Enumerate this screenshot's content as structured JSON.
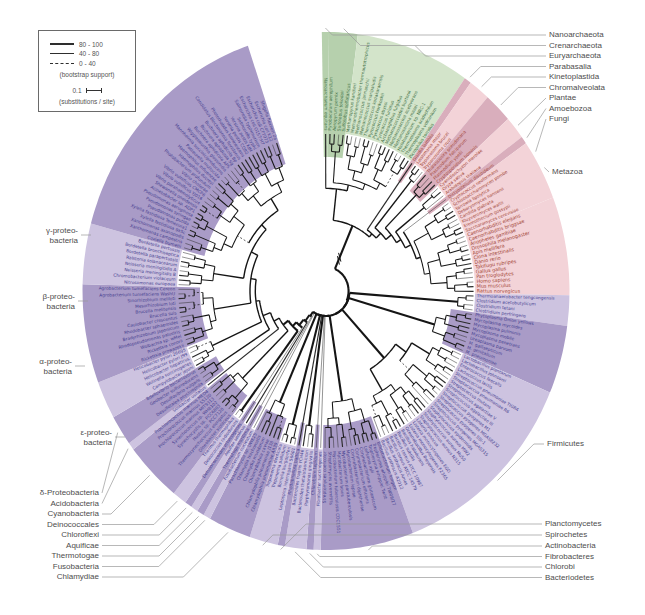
{
  "legend": {
    "items": [
      {
        "style": "thick",
        "label": "80 - 100"
      },
      {
        "style": "thin",
        "label": "40 - 80"
      },
      {
        "style": "dashed",
        "label": "0 - 40"
      }
    ],
    "caption": "(bootstrap support)",
    "scale_value": "0.1",
    "scale_caption": "(substitutions / site)"
  },
  "figure": {
    "cx": 326,
    "cy": 291,
    "kx": 0.94,
    "outer_r": 259,
    "label_r": 160.5,
    "light_inner_r": 158.5,
    "dark_inner_r": 134,
    "leaf_r": 157,
    "start_angle": -1,
    "arc_span": 342.3
  },
  "colors": {
    "green_dark": "#b6d0ad",
    "green_light": "#d3e4ca",
    "pink_dark": "#d9aebc",
    "pink_light": "#f3d3d8",
    "purple_dark": "#a99bc7",
    "purple_light": "#cdc3e0",
    "text_archaea": "#3f7046",
    "text_eukaryota": "#a14434",
    "text_bacteria": "#453e8f",
    "tree_line": "#151515",
    "connector": "#9a9a9a",
    "label_text": "#4d4d4d"
  },
  "groups": [
    {
      "id": "nanoarchaeota",
      "domain": "archaea",
      "band": "dark",
      "leaves": [
        "Nanoarchaeum equitans"
      ]
    },
    {
      "id": "crenarchaeota",
      "domain": "archaea",
      "band": "dark",
      "leaves": [
        "Pyrobaculum aerophilum",
        "Aeropyrum pernix",
        "Sulfolobus tokodaii",
        "Sulfolobus solfataricus"
      ]
    },
    {
      "id": "euryarchaeota",
      "domain": "archaea",
      "band": "light",
      "leaves": [
        "Methanopyrus kandleri",
        "Methanothermobacter thermautotrophicus",
        "Methanococcus jannaschii",
        "Methanococcus maripaludis",
        "Thermococcus kodakaraensis",
        "Pyrococcus horikoshii",
        "Pyrococcus abyssi",
        "Pyrococcus furiosus",
        "Archaeoglobus fulgidus",
        "Methanococcoides burtonii",
        "Methanosarcina acetivorans",
        "Methanosarcina mazei",
        "Halobacterium sp. NRC-1",
        "Thermoplasma acidophilum",
        "Thermoplasma volcanium",
        "Picrophilus torridus"
      ]
    },
    {
      "id": "parabasalia",
      "domain": "eukaryota",
      "band": "dark",
      "leaves": [
        "Giardia lamblia"
      ]
    },
    {
      "id": "kinetoplastida",
      "domain": "eukaryota",
      "band": "light",
      "leaves": [
        "Leishmania major",
        "Trypanosoma brucei",
        "Trypanosoma cruzi"
      ]
    },
    {
      "id": "chromalveolata",
      "domain": "eukaryota",
      "band": "dark",
      "leaves": [
        "Thalassiosira pseudonana",
        "Plasmodium falciparum",
        "Plasmodium yoelii",
        "Cryptosporidium hominis"
      ]
    },
    {
      "id": "plantae",
      "domain": "eukaryota",
      "band": "light",
      "leaves": [
        "Cyanidioschyzon merolae",
        "Oryza sativa",
        "Arabidopsis thaliana"
      ]
    },
    {
      "id": "amoebozoa",
      "domain": "eukaryota",
      "band": "dark",
      "leaves": [
        "Dictyostelium discoideum"
      ]
    },
    {
      "id": "fungi",
      "domain": "eukaryota",
      "band": "light",
      "leaves": [
        "Cryptococcus neoformans",
        "Schizosaccharomyces pombe",
        "Yarrowia lipolytica",
        "Debaryomyces hansenii",
        "Candida glabrata",
        "Kluyveromyces waltii",
        "Eremothecium gossypii",
        "Saccharomyces cerevisiae"
      ]
    },
    {
      "id": "metazoa",
      "domain": "eukaryota",
      "band": "light",
      "leaves": [
        "Caenorhabditis elegans",
        "Caenorhabditis briggsae",
        "Anopheles gambiae",
        "Drosophila melanogaster",
        "Apis mellifera",
        "Ciona intestinalis",
        "Danio rerio",
        "Takifugu rubripes",
        "Gallus gallus",
        "Pan troglodytes",
        "Homo sapiens",
        "Mus musculus",
        "Rattus norvegicus"
      ]
    },
    {
      "id": "clostridia",
      "domain": "bacteria",
      "band": "light",
      "leaves": [
        "Thermoanaerobacter tengcongensis",
        "Clostridium acetobutylicum",
        "Clostridium tetani",
        "Clostridium perfringens"
      ]
    },
    {
      "id": "mollicutes",
      "domain": "bacteria",
      "band": "dark",
      "leaves": [
        "Phytoplasma Onion yellows",
        "Mycoplasma mycoides",
        "Mycoplasma pulmonis",
        "Mycoplasma mobile",
        "Mycoplasma penetrans",
        "Ureaplasma parvum",
        "M. gallisepticum",
        "M. genitalium",
        "M. pneumoniae"
      ]
    },
    {
      "id": "bacilli",
      "domain": "bacteria",
      "band": "light",
      "leaves": [
        "Lactobacillus plantarum",
        "Lactobacillus johnsonii",
        "Enterococcus faecalis",
        "Lactococcus lactis",
        "Streptococcus pneumoniae TIGR4",
        "Streptococcus pneumoniae R6",
        "Streptococcus mutans",
        "Streptococcus agalactiae V",
        "Streptococcus agalactiae III",
        "Streptococcus pyogenes M1",
        "Streptococcus pyogenes MGAS8232",
        "Streptococcus pyogenes SSI-1",
        "Streptococcus pyogenes MGAS315",
        "Staphylococcus epidermidis",
        "Staphylococcus aureus MW2",
        "Staphylococcus aureus Mu50",
        "Staphylococcus aureus N315",
        "Listeria innocua",
        "Listeria monocytogenes EGD",
        "Listeria monocytogenes F2365",
        "Oceanobacillus iheyensis",
        "Bacillus halodurans",
        "Bacillus subtilis",
        "Bacillus cereus ATCC 10987",
        "Bacillus cereus ATCC 14579",
        "Bacillus anthracis Ames",
        "Bacillus anthracis A2012"
      ]
    },
    {
      "id": "actinobacteria",
      "domain": "bacteria",
      "band": "dark",
      "leaves": [
        "Bifidobacterium longum",
        "Tropheryma whipplei TW08/27",
        "Tropheryma whipplei Twist",
        "Leifsonia xyli",
        "Corynebacterium glutamicum",
        "Corynebacterium efficiens",
        "Corynebacterium diphtheriae",
        "Mycobacterium leprae",
        "Mycobacterium paratuberculosis",
        "Mycobacterium bovis",
        "Mycobacterium tuberculosis CDC1551",
        "Streptomyces avermitilis",
        "Streptomyces coelicolor"
      ]
    },
    {
      "id": "fibrobacteres",
      "domain": "bacteria",
      "band": "light",
      "leaves": [
        "Fibrobacter succinogenes"
      ]
    },
    {
      "id": "chlorobi",
      "domain": "bacteria",
      "band": "dark",
      "leaves": [
        "Chlorobium tepidum"
      ]
    },
    {
      "id": "bacteriodetes",
      "domain": "bacteria",
      "band": "light",
      "leaves": [
        "Porphyromonas gingivalis",
        "Bacteroides thetaiotaomicron",
        "Bacteroides fragilis YCH46"
      ]
    },
    {
      "id": "planctomycetes",
      "domain": "bacteria",
      "band": "dark",
      "leaves": [
        "Rhodopirellula baltica"
      ]
    },
    {
      "id": "spirochetes",
      "domain": "bacteria",
      "band": "light",
      "leaves": [
        "Leptospira interrogans 56601",
        "Borrelia burgdorferi",
        "Treponema pallidum",
        "Treponema denticola"
      ]
    },
    {
      "id": "chlamydiae",
      "domain": "bacteria",
      "band": "dark",
      "leaves": [
        "Chlamydophila pneumoniae AR39",
        "Chlamydophila pneumoniae J138",
        "Chlamydophila caviae",
        "Chlamydia muridarum",
        "Chlamydia trachomatis",
        "Parachlamydia sp. UWE25"
      ]
    },
    {
      "id": "fusobacteria",
      "domain": "bacteria",
      "band": "light",
      "leaves": [
        "Fusobacterium nucleatum"
      ]
    },
    {
      "id": "thermotogae",
      "domain": "bacteria",
      "band": "dark",
      "leaves": [
        "Thermotoga maritima"
      ]
    },
    {
      "id": "aquificae",
      "domain": "bacteria",
      "band": "light",
      "leaves": [
        "Aquifex aeolicus"
      ]
    },
    {
      "id": "chloroflexi",
      "domain": "bacteria",
      "band": "dark",
      "leaves": [
        "Dehalococcoides ethenogenes"
      ]
    },
    {
      "id": "deinococcales",
      "domain": "bacteria",
      "band": "light",
      "leaves": [
        "Deinococcus radiodurans",
        "Thermus thermophilus"
      ]
    },
    {
      "id": "cyanobacteria",
      "domain": "bacteria",
      "band": "dark",
      "leaves": [
        "Gloeobacter violaceus",
        "Thermosynechococcus elongatus",
        "Nostoc sp. PCC7120",
        "Synechocystis sp. PCC6803",
        "Synechococcus sp. WH8102",
        "Prochlorococcus marinus MIT9313",
        "Prochlorococcus marinus SS120",
        "Prochlorococcus marinus MED4"
      ]
    },
    {
      "id": "acidobacteria",
      "domain": "bacteria",
      "band": "light",
      "leaves": [
        "Solibacter usitatus"
      ]
    },
    {
      "id": "delta",
      "domain": "bacteria",
      "band": "dark",
      "leaves": [
        "Desulfotalea psychrophila",
        "Desulfovibrio vulgaris",
        "Geobacter sulfurreducens",
        "Bdellovibrio bacteriovorus"
      ]
    },
    {
      "id": "epsilon",
      "domain": "bacteria",
      "band": "light",
      "leaves": [
        "Campylobacter jejuni",
        "Wolinella succinogenes",
        "Helicobacter hepaticus",
        "Helicobacter pylori J99",
        "Helicobacter pylori 26695"
      ]
    },
    {
      "id": "alpha",
      "domain": "bacteria",
      "band": "dark",
      "leaves": [
        "Rickettsia prowazekii",
        "Rickettsia conorii",
        "Wolbachia sp. wMel",
        "Rhodopseudomonas palustris",
        "Bradyrhizobium japonicum",
        "Rhodobacter sphaeroides",
        "Caulobacter crescentus",
        "Brucella suis",
        "Brucella melitensis",
        "Mesorhizobium loti",
        "Sinorhizobium meliloti",
        "Agrobacterium tumefaciens WashU",
        "Agrobacterium tumefaciens Cereon"
      ]
    },
    {
      "id": "beta",
      "domain": "bacteria",
      "band": "light",
      "leaves": [
        "Nitrosomonas europaea",
        "Chromobacterium violaceum",
        "Neisseria meningitidis B",
        "Neisseria meningitidis A",
        "Ralstonia solanacearum",
        "Bordetella parapertussis",
        "Bordetella bronchiseptica",
        "Bordetella pertussis"
      ]
    },
    {
      "id": "gamma",
      "domain": "bacteria",
      "band": "dark",
      "leaves": [
        "Coxiella burnetii",
        "Xanthomonas campestris",
        "Xanthomonas axonopodis",
        "Xylella fastidiosa 9a5c",
        "Xylella fastidiosa Temecula1",
        "Pseudomonas putida",
        "Pseudomonas syringae",
        "Pseudomonas aeruginosa",
        "Acinetobacter sp. ADP1",
        "Shewanella oneidensis",
        "Vibrio parahaemolyticus",
        "Vibrio vulnificus YJ016",
        "Vibrio vulnificus CMCP6",
        "Vibrio cholerae",
        "Photobacterium profundum",
        "Haemophilus ducreyi",
        "Haemophilus influenzae",
        "Pasteurella multocida",
        "Mannheimia succiniciproducens",
        "Wigglesworthia glossinidia",
        "Buchnera aphidicola APS",
        "Buchnera aphidicola Sg",
        "Buchnera aphidicola Bp",
        "Candidatus Blochmannia floridanus",
        "Photorhabdus luminescens",
        "Yersinia pestis CO92",
        "Yersinia pestis KIM",
        "Salmonella typhi",
        "Salmonella typhimurium",
        "Escherichia coli O157:H7",
        "Escherichia coli CFT073",
        "Escherichia coli K12",
        "Shigella flexneri 2a"
      ]
    }
  ],
  "external_labels": [
    {
      "text": "Nanoarchaeota",
      "x": 549,
      "y": 35,
      "side": "right",
      "group": "nanoarchaeota"
    },
    {
      "text": "Crenarchaeota",
      "x": 549,
      "y": 45.5,
      "side": "right",
      "group": "crenarchaeota"
    },
    {
      "text": "Euryarchaeota",
      "x": 549,
      "y": 56,
      "side": "right",
      "group": "euryarchaeota"
    },
    {
      "text": "Parabasalia",
      "x": 549,
      "y": 66.5,
      "side": "right",
      "group": "parabasalia"
    },
    {
      "text": "Kinetoplastida",
      "x": 549,
      "y": 77,
      "side": "right",
      "group": "kinetoplastida"
    },
    {
      "text": "Chromalveolata",
      "x": 549,
      "y": 87.5,
      "side": "right",
      "group": "chromalveolata"
    },
    {
      "text": "Plantae",
      "x": 549,
      "y": 98,
      "side": "right",
      "group": "plantae"
    },
    {
      "text": "Amoebozoa",
      "x": 549,
      "y": 108.5,
      "side": "right",
      "group": "amoebozoa"
    },
    {
      "text": "Fungi",
      "x": 549,
      "y": 119,
      "side": "right",
      "group": "fungi",
      "angle": 58
    },
    {
      "text": "Metazoa",
      "x": 552,
      "y": 172,
      "side": "right",
      "group": "metazoa",
      "angle": 62
    },
    {
      "text": "Firmicutes",
      "x": 547,
      "y": 444,
      "side": "right",
      "group": "bacilli"
    },
    {
      "text": "Planctomycetes",
      "x": 545,
      "y": 524,
      "side": "right",
      "group": "planctomycetes"
    },
    {
      "text": "Spirochetes",
      "x": 545,
      "y": 535,
      "side": "right",
      "group": "spirochetes"
    },
    {
      "text": "Actinobacteria",
      "x": 545,
      "y": 546,
      "side": "right",
      "group": "actinobacteria"
    },
    {
      "text": "Fibrobacteres",
      "x": 545,
      "y": 556.5,
      "side": "right",
      "group": "fibrobacteres"
    },
    {
      "text": "Chlorobi",
      "x": 545,
      "y": 567,
      "side": "right",
      "group": "chlorobi"
    },
    {
      "text": "Bacteriodetes",
      "x": 545,
      "y": 577.5,
      "side": "right",
      "group": "bacteriodetes"
    },
    {
      "text": "δ-Proteobacteria",
      "x": 99,
      "y": 493,
      "side": "left",
      "group": "delta"
    },
    {
      "text": "Acidobacteria",
      "x": 99,
      "y": 503.5,
      "side": "left",
      "group": "acidobacteria"
    },
    {
      "text": "Cyanobacteria",
      "x": 99,
      "y": 514,
      "side": "left",
      "group": "cyanobacteria"
    },
    {
      "text": "Deinococcales",
      "x": 99,
      "y": 524.5,
      "side": "left",
      "group": "deinococcales"
    },
    {
      "text": "Chloroflexi",
      "x": 99,
      "y": 535,
      "side": "left",
      "group": "chloroflexi"
    },
    {
      "text": "Aquificae",
      "x": 99,
      "y": 545.5,
      "side": "left",
      "group": "aquificae"
    },
    {
      "text": "Thermotogae",
      "x": 99,
      "y": 556,
      "side": "left",
      "group": "thermotogae"
    },
    {
      "text": "Fusobacteria",
      "x": 99,
      "y": 566.5,
      "side": "left",
      "group": "fusobacteria"
    },
    {
      "text": "Chlamydiae",
      "x": 99,
      "y": 577,
      "side": "left",
      "group": "chlamydiae"
    },
    {
      "lines": [
        "γ-proteo-",
        "bacteria"
      ],
      "x": 78,
      "y": 231,
      "side": "left-tick",
      "group": "gamma"
    },
    {
      "lines": [
        "β-proteo-",
        "bacteria"
      ],
      "x": 75,
      "y": 297,
      "side": "left-tick",
      "group": "beta"
    },
    {
      "lines": [
        "α-proteo-",
        "bacteria"
      ],
      "x": 72,
      "y": 362,
      "side": "left-tick",
      "group": "alpha"
    },
    {
      "lines": [
        "ε-proteo-",
        "bacteria"
      ],
      "x": 112,
      "y": 433,
      "side": "left-tick",
      "group": "epsilon"
    }
  ]
}
